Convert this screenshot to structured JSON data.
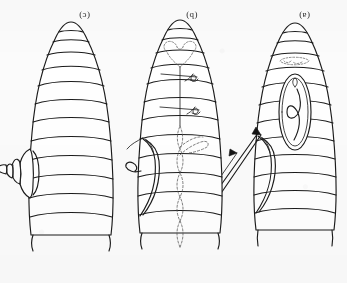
{
  "figure": {
    "kind": "scientific-line-drawing",
    "orientation_note": "plate reproduced upside-down (rotated 180 degrees)",
    "background_color": "#fbfbfb",
    "ink_color": "#1b1b1b",
    "dashed_ink_color": "#555555"
  },
  "panels": [
    {
      "id": "panel-c",
      "caption": "(c)",
      "caption_x": 79,
      "caption_y": 11,
      "description": "larva with telescoping segmented ovipositor extruded laterally",
      "segment_count": 13
    },
    {
      "id": "panel-b",
      "caption": "(b)",
      "caption_x": 186,
      "caption_y": 11,
      "description": "larva with lateral incision flap and dashed internal beaded trunk",
      "segment_count": 13
    },
    {
      "id": "panel-a",
      "caption": "(a)",
      "caption_x": 299,
      "caption_y": 11,
      "description": "larva with needle arrow at incision and ovoid cocoon containing coiled larva",
      "segment_count": 13
    }
  ],
  "annotations": {
    "arrow_label": "needle-arrow",
    "cocoon_label": "ovoid-cocoon",
    "ovipositor_label": "telescoping-ovipositor",
    "flap_label": "incision-flap",
    "trunk_label": "dashed-internal-trunk"
  }
}
